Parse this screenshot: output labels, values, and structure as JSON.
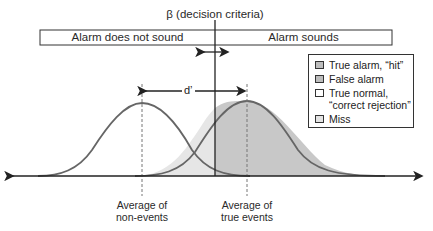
{
  "diagram": {
    "title": "β (decision criteria)",
    "decision_bar": {
      "left_label": "Alarm does not sound",
      "right_label": "Alarm sounds"
    },
    "sensitivity_label": "d’",
    "axis_labels": {
      "noise_mean": "Average of non-events",
      "noise_mean_line1": "Average of",
      "noise_mean_line2": "non-events",
      "signal_mean": "Average of true events",
      "signal_mean_line1": "Average of",
      "signal_mean_line2": "true events"
    },
    "legend": [
      {
        "label": "True alarm, “hit”",
        "color": "#bdbdbd"
      },
      {
        "label": "False alarm",
        "color": "#bdbdbd"
      },
      {
        "label_line1": "True normal,",
        "label_line2": "“correct rejection”",
        "label": "True normal, “correct rejection”",
        "color": "#ffffff"
      },
      {
        "label": "Miss",
        "color": "#e3e3e3"
      }
    ],
    "colors": {
      "curve": "#555555",
      "hit_fill": "#c8c8c8",
      "miss_fill": "#e6e6e6",
      "axis": "#222222"
    }
  }
}
